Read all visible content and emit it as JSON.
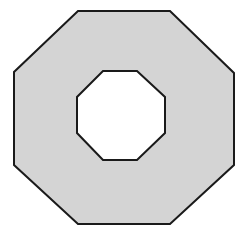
{
  "figure": {
    "name": "octagonal-ring",
    "canvas": {
      "width": 239,
      "height": 244
    },
    "background_color": "#ffffff",
    "outer_shape": {
      "name": "outer-octagon",
      "sides": 8,
      "fill_color": "#d4d4d4",
      "stroke_color": "#1a1a1a",
      "stroke_width": 2,
      "points": "78,11 170,11 234,73 234,165 170,224 78,224 14,165 14,72"
    },
    "inner_shape": {
      "name": "inner-octagon-hole",
      "sides": 8,
      "fill_color": "#ffffff",
      "stroke_color": "#1a1a1a",
      "stroke_width": 2,
      "points": "103,71 137,71 165,97 165,133 137,160 103,160 77,133 77,97"
    }
  }
}
